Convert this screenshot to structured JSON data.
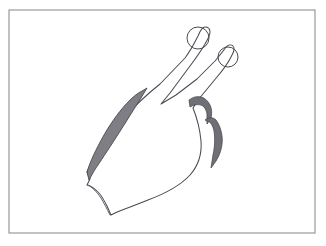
{
  "image": {
    "title": "Hand gesture line drawing",
    "subject": "hand-peace-sign",
    "description": "Black-and-white line drawing of a left hand raised with index and middle fingers extended in a V / peace sign, remaining fingers folded, shown inside a thin rectangular frame",
    "style": "pen-and-ink line art with gray shading",
    "orientation": "fingers point toward upper right"
  },
  "canvas": {
    "width": 326,
    "height": 246,
    "background_color": "#ffffff"
  },
  "frame": {
    "name": "rectangular-border",
    "x": 9,
    "y": 10,
    "width": 306,
    "height": 223,
    "stroke_color": "#8e9095",
    "stroke_width": 1.1,
    "fill_color": "#ffffff"
  },
  "palette": {
    "ink": "#4a4a52",
    "shadow_gray": "#7e7e84",
    "deep_shadow_gray": "#6f6f76",
    "paper_white": "#ffffff",
    "frame_gray": "#8e9095"
  },
  "parts": [
    {
      "name": "hand-outline",
      "label": "Hand silhouette",
      "fill": "#ffffff",
      "stroke": "#4a4a52"
    },
    {
      "name": "index-finger",
      "label": "Index finger",
      "state": "extended",
      "direction": "upper-right",
      "tip_x": 200,
      "tip_y": 32
    },
    {
      "name": "middle-finger",
      "label": "Middle finger",
      "state": "extended",
      "direction": "upper-right",
      "tip_x": 228,
      "tip_y": 49
    },
    {
      "name": "index-fingernail",
      "label": "Index fingernail",
      "shape": "circle",
      "cx": 198,
      "cy": 38,
      "r": 11
    },
    {
      "name": "middle-fingernail",
      "label": "Middle fingernail",
      "shape": "circle",
      "cx": 228,
      "cy": 57,
      "r": 10
    },
    {
      "name": "finger-v-junction",
      "label": "Gap between extended fingers",
      "x": 161,
      "y": 104
    },
    {
      "name": "thumb-shadow",
      "label": "Shaded thumb edge",
      "fill": "#7e7e84",
      "side": "left"
    },
    {
      "name": "folded-finger-shadow-upper",
      "label": "Upper folded-finger shadow crescent",
      "fill": "#6f6f76",
      "side": "right"
    },
    {
      "name": "folded-finger-shadow-lower",
      "label": "Lower folded-finger shadow crescent",
      "fill": "#6f6f76",
      "side": "right"
    },
    {
      "name": "wrist-edge",
      "label": "Wrist / bottom edge of hand",
      "shape": "wavy-line"
    }
  ],
  "geometry": {
    "hand_path": "M 87 172 L 88 170 C 96 156 110 136 126 118 C 140 102 152 92 162 84 L 186 58 C 192 50 196 42 199 36 C 201 31 203 28 204 27 C 206 26 209 27 210 29 C 211 32 210 35 208 39 C 205 45 200 53 194 62 L 170 96 L 163 105 L 176 98 L 196 83 L 214 66 C 220 59 224 53 226 49 C 228 46 231 45 233 47 C 235 49 234 52 232 56 C 229 62 224 69 218 76 L 199 99 L 193 107 L 196 118 C 199 128 201 139 201 148 C 201 160 197 170 190 178 C 181 188 166 196 150 202 C 138 207 126 211 117 214 L 112 216 L 108 207 C 105 201 102 196 99 193 C 96 190 93 188 91 187 L 88 186 L 91 180 Z",
    "thumb_shadow_path": "M 87 172 C 90 163 96 150 104 136 C 112 122 121 110 130 101 C 134 97 138 94 141 92 L 145 90 L 140 99 C 134 109 126 121 118 134 C 109 148 101 161 95 170 L 89 179 Z",
    "folded_shadow_upper_path": "M 191 101 C 194 99 197 98 200 98 C 204 98 207 100 209 103 C 211 106 212 110 211 113 L 208 119 L 207 112 C 206 108 204 105 201 104 C 198 103 194 104 191 106 Z",
    "folded_shadow_lower_path": "M 206 120 C 209 118 212 118 214 120 C 217 122 219 127 220 133 C 221 141 219 150 214 158 L 210 164 L 212 153 C 214 144 214 136 213 130 C 212 125 210 122 207 121 Z",
    "index_nail": {
      "cx": 198,
      "cy": 38,
      "r": 11
    },
    "middle_nail": {
      "cx": 228,
      "cy": 57,
      "r": 10
    }
  }
}
